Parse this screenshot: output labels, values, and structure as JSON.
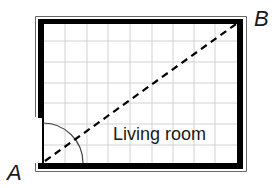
{
  "diagram": {
    "type": "floor-plan",
    "room_label": "Living room",
    "points": [
      {
        "name": "A",
        "position": "bottom-left corner"
      },
      {
        "name": "B",
        "position": "top-right corner"
      }
    ],
    "grid": {
      "columns": 9,
      "rows": 7
    },
    "diagonal": {
      "from": "A",
      "to": "B",
      "style": "dashed"
    },
    "door": {
      "location": "left wall, bottom",
      "swing": "quarter-circle"
    },
    "colors": {
      "wall": "#000000",
      "grid": "#d0d0d0",
      "outline": "#555555",
      "text": "#1a1a1a"
    }
  }
}
